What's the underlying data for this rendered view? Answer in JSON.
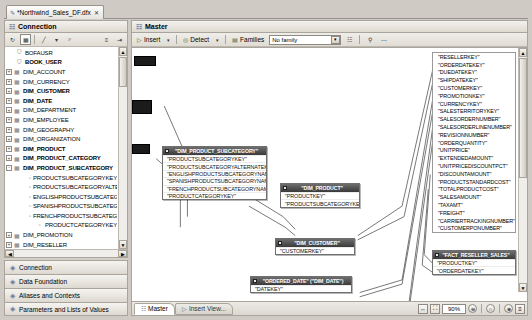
{
  "document_tab": {
    "title": "*Northwind_Sales_DF.dfx",
    "icon": "document-icon",
    "close": "✕"
  },
  "connection_panel": {
    "header": "Connection",
    "header_icon": "connection-icon",
    "toolbar": [
      {
        "name": "refresh-button",
        "glyph": "⟳"
      },
      {
        "name": "insert-table-button",
        "glyph": "▦"
      },
      {
        "name": "filter-button",
        "glyph": "╱"
      },
      {
        "name": "filter-dropdown",
        "glyph": "▾"
      },
      {
        "name": "search-button",
        "glyph": "⌕"
      },
      {
        "name": "list-view-button",
        "glyph": "≡"
      },
      {
        "name": "expand-all-button",
        "glyph": "⇲"
      }
    ],
    "tree": [
      {
        "label": "BOFAUSR",
        "indent": 0,
        "icon": "user-icon",
        "expander": "",
        "bold": false
      },
      {
        "label": "BOOK_USER",
        "indent": 0,
        "icon": "user-icon",
        "expander": "",
        "bold": true
      },
      {
        "label": "DIM_ACCOUNT",
        "indent": 0,
        "icon": "table-icon",
        "expander": "+",
        "bold": false
      },
      {
        "label": "DIM_CURRENCY",
        "indent": 0,
        "icon": "table-icon",
        "expander": "+",
        "bold": false
      },
      {
        "label": "DIM_CUSTOMER",
        "indent": 0,
        "icon": "table-icon",
        "expander": "+",
        "bold": true
      },
      {
        "label": "DIM_DATE",
        "indent": 0,
        "icon": "table-icon",
        "expander": "+",
        "bold": true
      },
      {
        "label": "DIM_DEPARTMENT",
        "indent": 0,
        "icon": "table-icon",
        "expander": "+",
        "bold": false
      },
      {
        "label": "DIM_EMPLOYEE",
        "indent": 0,
        "icon": "table-icon",
        "expander": "+",
        "bold": false
      },
      {
        "label": "DIM_GEOGRAPHY",
        "indent": 0,
        "icon": "table-icon",
        "expander": "+",
        "bold": false
      },
      {
        "label": "DIM_ORGANIZATION",
        "indent": 0,
        "icon": "table-icon",
        "expander": "+",
        "bold": false
      },
      {
        "label": "DIM_PRODUCT",
        "indent": 0,
        "icon": "table-icon",
        "expander": "+",
        "bold": true
      },
      {
        "label": "DIM_PRODUCT_CATEGORY",
        "indent": 0,
        "icon": "table-icon",
        "expander": "+",
        "bold": true
      },
      {
        "label": "DIM_PRODUCT_SUBCATEGORY",
        "indent": 0,
        "icon": "table-icon",
        "expander": "-",
        "bold": true
      },
      {
        "label": "PRODUCTSUBCATEGORYKEY",
        "indent": 2,
        "icon": "column-icon",
        "expander": "",
        "bold": false
      },
      {
        "label": "PRODUCTSUBCATEGORYALTERNATEKEY",
        "indent": 2,
        "icon": "column-icon",
        "expander": "",
        "bold": false
      },
      {
        "label": "ENGLISHPRODUCTSUBCATEGORYNAME",
        "indent": 2,
        "icon": "column-icon",
        "expander": "",
        "bold": false
      },
      {
        "label": "SPANISHPRODUCTSUBCATEGORYNAME",
        "indent": 2,
        "icon": "column-icon",
        "expander": "",
        "bold": false
      },
      {
        "label": "FRENCHPRODUCTSUBCATEGORYNAME",
        "indent": 2,
        "icon": "column-icon",
        "expander": "",
        "bold": false
      },
      {
        "label": "PRODUCTCATEGORYKEY",
        "indent": 2,
        "icon": "column-icon",
        "expander": "",
        "bold": false
      },
      {
        "label": "DIM_PROMOTION",
        "indent": 0,
        "icon": "table-icon",
        "expander": "+",
        "bold": false
      },
      {
        "label": "DIM_RESELLER",
        "indent": 0,
        "icon": "table-icon",
        "expander": "+",
        "bold": false
      },
      {
        "label": "DIM_SALES_TERRITORY",
        "indent": 0,
        "icon": "table-icon",
        "expander": "+",
        "bold": false
      },
      {
        "label": "DIM_SCENARIO",
        "indent": 0,
        "icon": "table-icon",
        "expander": "+",
        "bold": false
      }
    ]
  },
  "accordion": [
    {
      "label": "Connection",
      "icon": "connection-icon"
    },
    {
      "label": "Data Foundation",
      "icon": "data-foundation-icon"
    },
    {
      "label": "Aliases and Contexts",
      "icon": "aliases-icon"
    },
    {
      "label": "Parameters and Lists of Values",
      "icon": "parameters-icon"
    }
  ],
  "editor": {
    "header": "Master",
    "header_icon": "master-view-icon",
    "toolbar": {
      "insert_label": "Insert",
      "insert_icon": "insert-icon",
      "detect_label": "Detect",
      "detect_icon": "detect-icon",
      "families_label": "Families",
      "families_icon": "families-icon",
      "family_value": "No family",
      "family_options": [
        "No family"
      ],
      "show_values_icon": "show-values-icon",
      "view_icon": "view-icon",
      "help_icon": "help-icon",
      "more_icon": "more-icon"
    }
  },
  "diagram": {
    "tables": [
      {
        "name": "\"DIM_PRODUCT_SUBCATEGORY\"",
        "fields": [
          "\"PRODUCTSUBCATEGORYKEY\"",
          "\"PRODUCTSUBCATEGORYALTERNATEKEY\"",
          "\"ENGLISHPRODUCTSUBCATEGORYNAME\"",
          "\"SPANISHPRODUCTSUBCATEGORYNAME\"",
          "\"FRENCHPRODUCTSUBCATEGORYNAME\"",
          "\"PRODUCTCATEGORYKEY\""
        ]
      },
      {
        "name": "\"DIM_PRODUCT\"",
        "fields": [
          "\"PRODUCTKEY\"",
          "\"PRODUCTSUBCATEGORYKEY\""
        ]
      },
      {
        "name": "\"DIM_CUSTOMER\"",
        "fields": [
          "\"CUSTOMERKEY\""
        ]
      },
      {
        "name": "\"ORDERED_DATE\" (\"DIM_DATE\")",
        "fields": [
          "\"DATEKEY\""
        ]
      },
      {
        "name": "\"FACT_RESELLER_SALES\"",
        "fields": [
          "\"PRODUCTKEY\"",
          "\"ORDERDATEKEY\""
        ]
      }
    ],
    "field_list": [
      "\"RESELLERKEY\"",
      "\"ORDERDATEKEY\"",
      "\"DUEDATEKEY\"",
      "\"SHIPDATEKEY\"",
      "\"CUSTOMERKEY\"",
      "\"PROMOTIONKEY\"",
      "\"CURRENCYKEY\"",
      "\"SALESTERRITORYKEY\"",
      "\"SALESORDERNUMBER\"",
      "\"SALESORDERLINENUMBER\"",
      "\"REVISIONNUMBER\"",
      "\"ORDERQUANTITY\"",
      "\"UNITPRICE\"",
      "\"EXTENDEDAMOUNT\"",
      "\"UNITPRICEDISCOUNTPCT\"",
      "\"DISCOUNTAMOUNT\"",
      "\"PRODUCTSTANDARDCOST\"",
      "\"TOTALPRODUCTCOST\"",
      "\"SALESAMOUNT\"",
      "\"TAXAMT\"",
      "\"FREIGHT\"",
      "\"CARRIERTRACKINGNUMBER\"",
      "\"CUSTOMERPONUMBER\""
    ]
  },
  "statusbar": {
    "view_tabs": [
      {
        "label": "Master",
        "icon": "master-view-icon",
        "active": true
      },
      {
        "label": "Insert View...",
        "icon": "insert-view-icon",
        "active": false
      }
    ],
    "fit_width_icon": "fit-width-icon",
    "fit_page_icon": "fit-page-icon",
    "zoom_value": "90%",
    "zoom_out_icon": "⊖",
    "zoom_slider_icon": "○",
    "zoom_in_icon": "⊕",
    "zoom_menu_icon": "≡"
  }
}
